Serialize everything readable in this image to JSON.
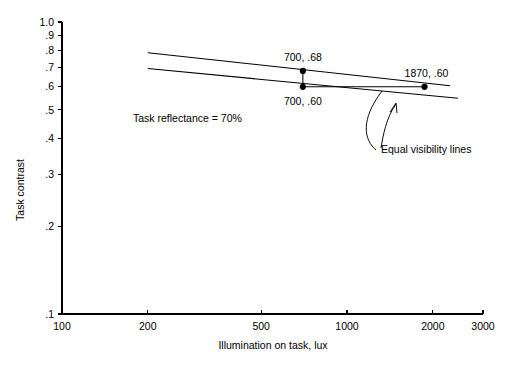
{
  "chart_data": {
    "type": "line",
    "title": "",
    "xlabel": "Illumination on task, lux",
    "ylabel": "Task contrast",
    "xscale": "log",
    "yscale": "log",
    "xlim": [
      100,
      3000
    ],
    "ylim": [
      0.1,
      1.0
    ],
    "grid": false,
    "legend": "none",
    "xticks": [
      {
        "value": 100,
        "label": "100"
      },
      {
        "value": 200,
        "label": "200"
      },
      {
        "value": 500,
        "label": "500"
      },
      {
        "value": 1000,
        "label": "1000"
      },
      {
        "value": 2000,
        "label": "2000"
      },
      {
        "value": 3000,
        "label": "3000"
      }
    ],
    "yticks": [
      {
        "value": 1.0,
        "label": "1.0"
      },
      {
        "value": 0.9,
        "label": ".9"
      },
      {
        "value": 0.8,
        "label": ".8"
      },
      {
        "value": 0.7,
        "label": ".7"
      },
      {
        "value": 0.6,
        "label": ".6"
      },
      {
        "value": 0.5,
        "label": ".5"
      },
      {
        "value": 0.4,
        "label": ".4"
      },
      {
        "value": 0.3,
        "label": ".3"
      },
      {
        "value": 0.2,
        "label": ".2"
      },
      {
        "value": 0.1,
        "label": ".1"
      }
    ],
    "series": [
      {
        "name": "Upper equal visibility line",
        "x": [
          200,
          2300
        ],
        "y": [
          0.785,
          0.605
        ]
      },
      {
        "name": "Lower equal visibility line",
        "x": [
          200,
          2450
        ],
        "y": [
          0.693,
          0.548
        ]
      }
    ],
    "points": [
      {
        "label": "700, .68",
        "x": 700,
        "y": 0.68,
        "label_dx": 0,
        "label_dy": -10,
        "anchor": "middle"
      },
      {
        "label": "700, .60",
        "x": 700,
        "y": 0.6,
        "label_dx": 0,
        "label_dy": 18,
        "anchor": "middle"
      },
      {
        "label": "1870, .60",
        "x": 1870,
        "y": 0.6,
        "label_dx": 2,
        "label_dy": -10,
        "anchor": "middle"
      }
    ],
    "connectors": [
      {
        "name": "vertical-contrast-drop",
        "from": {
          "x": 700,
          "y": 0.68
        },
        "to": {
          "x": 700,
          "y": 0.6
        }
      },
      {
        "name": "horizontal-illuminance-increase",
        "from": {
          "x": 700,
          "y": 0.6
        },
        "to": {
          "x": 1870,
          "y": 0.6
        }
      }
    ],
    "annotations": [
      {
        "name": "task-reflectance-note",
        "text": "Task reflectance = 70%",
        "x": 133,
        "y": 122,
        "anchor": "start"
      },
      {
        "name": "equal-visibility-label",
        "text": "Equal visibility lines",
        "x": 381,
        "y": 153,
        "anchor": "start"
      }
    ]
  }
}
